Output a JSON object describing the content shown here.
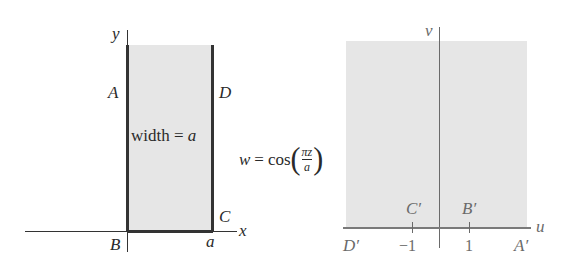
{
  "diagram": {
    "z_plane": {
      "axis_x_label": "x",
      "axis_y_label": "y",
      "points": {
        "A": "A",
        "B": "B",
        "C": "C",
        "D": "D"
      },
      "width_label_text": "width = ",
      "width_label_var": "a",
      "x_tick_label": "a",
      "region": "semi-infinite vertical strip 0 ≤ x ≤ a, y ≥ 0",
      "fill_color": "#e6e6e6",
      "boundary_color": "#333333"
    },
    "mapping": {
      "lhs": "w",
      "equals": "=",
      "func": "cos",
      "numerator": "πz",
      "denominator": "a",
      "open_paren": "(",
      "close_paren": ")"
    },
    "w_plane": {
      "axis_u_label": "u",
      "axis_v_label": "v",
      "points": {
        "A_prime": "A′",
        "B_prime": "B′",
        "C_prime": "C′",
        "D_prime": "D′"
      },
      "ticks": [
        "−1",
        "1"
      ],
      "region": "upper half-plane v ≥ 0",
      "fill_color": "#e6e6e6",
      "axis_color": "#6a6a6a",
      "boundary_color": "#7a7a7a"
    }
  }
}
